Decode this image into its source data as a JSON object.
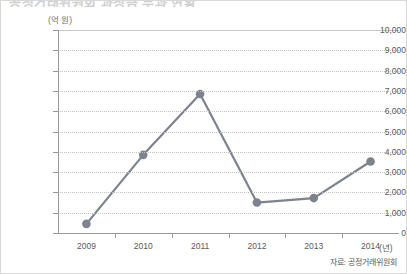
{
  "figure": {
    "top_cropped_text": "공정거래위원회 과징금 부과 현황",
    "source_note": "자료: 공정거래위원회",
    "line_color": "#7c838f",
    "marker_color": "#7c838f",
    "grid_color": "#c2c2c2",
    "axis_color": "#9a9a9a"
  },
  "chart_data": {
    "type": "line",
    "title": "",
    "xlabel": "(년)",
    "ylabel": "(억 원)",
    "categories": [
      "2009",
      "2010",
      "2011",
      "2012",
      "2013",
      "2014"
    ],
    "values": [
      450,
      3850,
      6850,
      1500,
      1720,
      3520
    ],
    "series": [
      {
        "name": "과징금",
        "values": [
          450,
          3850,
          6850,
          1500,
          1720,
          3520
        ]
      }
    ],
    "ylim": [
      0,
      10000
    ],
    "ytick_values": [
      0,
      1000,
      2000,
      3000,
      4000,
      5000,
      6000,
      7000,
      8000,
      9000,
      10000
    ],
    "ytick_labels": [
      "0",
      "1,000",
      "2,000",
      "3,000",
      "4,000",
      "5,000",
      "6,000",
      "7,000",
      "8,000",
      "9,000",
      "10,000"
    ],
    "grid": true,
    "legend": false,
    "markers": true
  }
}
